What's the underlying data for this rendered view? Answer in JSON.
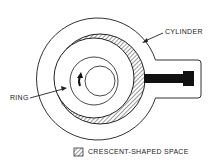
{
  "diagram": {
    "type": "rotary-compressor-cross-section",
    "labels": {
      "cylinder": "CYLINDER",
      "ring": "RING"
    },
    "legend": {
      "crescent": "CRESCENT-SHAPED SPACE"
    },
    "colors": {
      "stroke": "#333333",
      "hatch": "#555555",
      "vane": "#111111",
      "background": "#ffffff"
    }
  }
}
